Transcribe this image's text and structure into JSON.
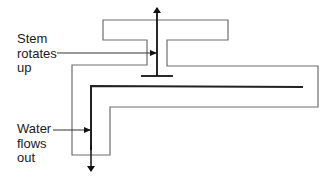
{
  "diagram": {
    "type": "faucet-valve-cross-section",
    "labels": {
      "stem": {
        "lines": [
          "Stem",
          "rotates",
          "up"
        ]
      },
      "water": {
        "lines": [
          "Water",
          "flows",
          "out"
        ]
      }
    },
    "colors": {
      "outline": "#6e6e6e",
      "stem": "#111111",
      "background": "#ffffff"
    }
  }
}
